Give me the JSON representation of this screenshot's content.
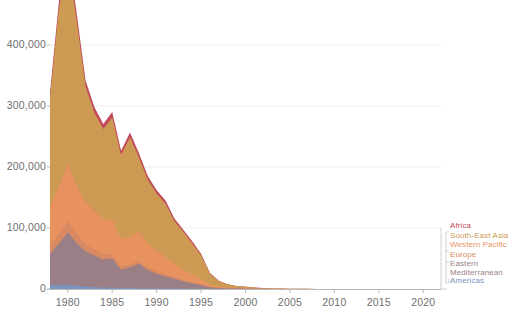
{
  "chart_data": {
    "type": "area",
    "title": "",
    "subtitle": "",
    "xlabel": "",
    "ylabel": "",
    "stacked": true,
    "grid": true,
    "legend_position": "right",
    "xlim": [
      1978,
      2022
    ],
    "ylim": [
      0,
      470000
    ],
    "x_ticks": [
      "1980",
      "1985",
      "1990",
      "1995",
      "2000",
      "2005",
      "2010",
      "2015",
      "2020"
    ],
    "x_tick_values": [
      1980,
      1985,
      1990,
      1995,
      2000,
      2005,
      2010,
      2015,
      2020
    ],
    "y_ticks": [
      "0",
      "100,000",
      "200,000",
      "300,000",
      "400,000"
    ],
    "y_tick_values": [
      0,
      100000,
      200000,
      300000,
      400000
    ],
    "x": [
      1978,
      1979,
      1980,
      1981,
      1982,
      1983,
      1984,
      1985,
      1986,
      1987,
      1988,
      1989,
      1990,
      1991,
      1992,
      1993,
      1994,
      1995,
      1996,
      1997,
      1998,
      1999,
      2000,
      2001,
      2002,
      2003,
      2004,
      2005,
      2006,
      2007,
      2008,
      2009,
      2010,
      2011,
      2012,
      2013,
      2014,
      2015,
      2016,
      2017,
      2018,
      2019,
      2020,
      2021
    ],
    "series": [
      {
        "name": "Americas",
        "color": "#7b94bd",
        "values": [
          6000,
          6500,
          7000,
          5500,
          4000,
          3000,
          2500,
          2000,
          1800,
          1600,
          1400,
          1200,
          1000,
          900,
          800,
          700,
          600,
          500,
          300,
          200,
          120,
          80,
          60,
          40,
          20,
          10,
          5,
          3,
          2,
          1,
          1,
          0,
          0,
          0,
          0,
          0,
          0,
          0,
          0,
          0,
          0,
          0,
          0,
          0
        ]
      },
      {
        "name": "Eastern Mediterranean",
        "color": "#9a7f86",
        "values": [
          52000,
          68000,
          86000,
          70000,
          58000,
          52000,
          46000,
          48000,
          30000,
          34000,
          40000,
          30000,
          24000,
          20000,
          16000,
          12000,
          9000,
          6000,
          2500,
          1400,
          900,
          700,
          500,
          300,
          200,
          150,
          100,
          80,
          60,
          40,
          30,
          20,
          15,
          10,
          8,
          6,
          5,
          4,
          3,
          2,
          2,
          1,
          1,
          1
        ]
      },
      {
        "name": "Europe",
        "color": "#d98a62",
        "values": [
          14000,
          16000,
          18000,
          15000,
          12000,
          10000,
          8000,
          7000,
          6000,
          5000,
          4500,
          4000,
          3500,
          3000,
          2500,
          2000,
          1500,
          1000,
          600,
          400,
          250,
          150,
          100,
          60,
          40,
          25,
          15,
          10,
          8,
          5,
          4,
          3,
          2,
          2,
          1,
          1,
          1,
          1,
          0,
          0,
          0,
          0,
          0,
          0
        ]
      },
      {
        "name": "Western Pacific",
        "color": "#e8935f",
        "values": [
          62000,
          78000,
          94000,
          80000,
          68000,
          62000,
          58000,
          56000,
          44000,
          46000,
          48000,
          40000,
          34000,
          28000,
          22000,
          17000,
          12000,
          8000,
          3500,
          2000,
          1200,
          800,
          600,
          350,
          220,
          150,
          100,
          70,
          50,
          35,
          25,
          18,
          12,
          9,
          7,
          5,
          4,
          3,
          2,
          2,
          1,
          1,
          1,
          1
        ]
      },
      {
        "name": "South-East Asia",
        "color": "#cd9a53",
        "values": [
          180000,
          290000,
          334000,
          270000,
          190000,
          162000,
          148000,
          168000,
          138000,
          162000,
          122000,
          104000,
          94000,
          88000,
          70000,
          62000,
          52000,
          40000,
          18000,
          9000,
          5000,
          3000,
          2500,
          1600,
          900,
          600,
          400,
          280,
          200,
          140,
          100,
          70,
          50,
          36,
          26,
          20,
          15,
          12,
          9,
          7,
          5,
          4,
          3,
          2
        ]
      },
      {
        "name": "Africa",
        "color": "#c0485a",
        "values": [
          8000,
          12000,
          15000,
          12000,
          10000,
          9000,
          8000,
          9000,
          7000,
          8000,
          7000,
          6000,
          5500,
          5000,
          4200,
          3600,
          3000,
          2400,
          1200,
          700,
          450,
          300,
          250,
          160,
          100,
          70,
          50,
          35,
          25,
          18,
          13,
          9,
          7,
          5,
          4,
          3,
          2,
          2,
          1,
          1,
          1,
          1,
          1,
          1
        ]
      }
    ],
    "legend_entries": [
      {
        "label": "Africa",
        "color": "#c0485a"
      },
      {
        "label": "South-East Asia",
        "color": "#cd9a53"
      },
      {
        "label": "Western Pacific",
        "color": "#e8935f"
      },
      {
        "label": "Europe",
        "color": "#d98a62"
      },
      {
        "label": "Eastern Mediterranean",
        "color": "#9a7f86"
      },
      {
        "label": "Americas",
        "color": "#7b94bd"
      }
    ]
  },
  "axes": {
    "y_labels": [
      "400,000",
      "300,000",
      "200,000",
      "100,000",
      "0"
    ],
    "x_labels": [
      "1980",
      "1985",
      "1990",
      "1995",
      "2000",
      "2005",
      "2010",
      "2015",
      "2020"
    ]
  },
  "legend": {
    "items": [
      {
        "label": "Africa"
      },
      {
        "label": "South-East Asia"
      },
      {
        "label": "Western Pacific"
      },
      {
        "label": "Europe"
      },
      {
        "label": "Eastern Mediterranean"
      },
      {
        "label": "Americas"
      }
    ]
  },
  "colors": {
    "africa": "#c0485a",
    "south_east_asia": "#cd9a53",
    "western_pacific": "#e8935f",
    "europe": "#d98a62",
    "eastern_mediterranean": "#9a7f86",
    "americas": "#7b94bd",
    "axis_text": "#6f6f6f",
    "gridline": "#f2efe6"
  }
}
